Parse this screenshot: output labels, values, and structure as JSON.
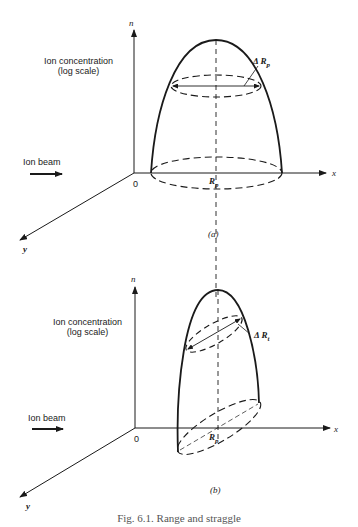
{
  "figure": {
    "caption": "Fig. 6.1. Range and straggle",
    "panels": [
      {
        "id": "a",
        "panel_label": "(a)",
        "axis_n_label": "n",
        "axis_x_label": "x",
        "axis_y_label": "y",
        "origin_label": "0",
        "concentration_label_line1": "Ion concentration",
        "concentration_label_line2": "(log scale)",
        "beam_label": "Ion beam",
        "range_label": "R",
        "range_sub": "p",
        "straggle_label": "Δ R",
        "straggle_sub": "p"
      },
      {
        "id": "b",
        "panel_label": "(b)",
        "axis_n_label": "n",
        "axis_x_label": "x",
        "axis_y_label": "y",
        "origin_label": "0",
        "concentration_label_line1": "Ion concentration",
        "concentration_label_line2": "(log scale)",
        "beam_label": "Ion beam",
        "range_label": "R",
        "range_sub": "p",
        "straggle_label": "Δ R",
        "straggle_sub": "t"
      }
    ]
  }
}
